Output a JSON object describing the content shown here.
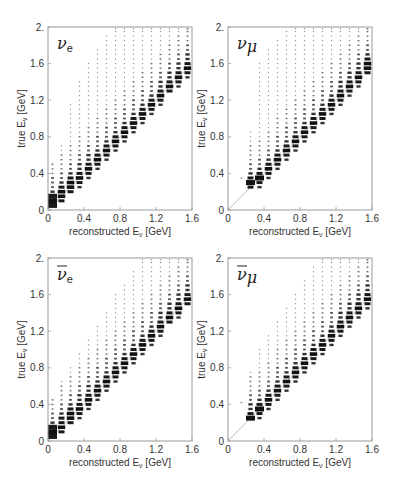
{
  "figure": {
    "panels": [
      {
        "id": "nu_e",
        "label_base": "ν",
        "label_sub": "e",
        "bar": false
      },
      {
        "id": "nu_mu",
        "label_base": "ν",
        "label_sub": "μ",
        "bar": false
      },
      {
        "id": "nubar_e",
        "label_base": "ν",
        "label_sub": "e",
        "bar": true
      },
      {
        "id": "nubar_mu",
        "label_base": "ν",
        "label_sub": "μ",
        "bar": true
      }
    ],
    "xlabel": "reconstructed E",
    "xlabel_sub": "ν",
    "xlabel_unit": " [GeV]",
    "ylabel": "true E",
    "ylabel_sub": "ν",
    "ylabel_unit": " [GeV]",
    "xticks": [
      "0",
      "0.4",
      "0.8",
      "1.2",
      "1.6"
    ],
    "yticks": [
      "0",
      "0.4",
      "0.8",
      "1.2",
      "1.6",
      "2."
    ]
  },
  "chart_data": [
    {
      "type": "heatmap",
      "title": "ν_e",
      "xlabel": "reconstructed E_ν [GeV]",
      "ylabel": "true E_ν [GeV]",
      "xlim": [
        0,
        1.6
      ],
      "ylim": [
        0,
        2.0
      ],
      "xticks": [
        0,
        0.4,
        0.8,
        1.2,
        1.6
      ],
      "yticks": [
        0,
        0.4,
        0.8,
        1.2,
        1.6,
        2.0
      ],
      "diagonal_reference": true,
      "x_bin_centers": [
        0.05,
        0.15,
        0.25,
        0.35,
        0.45,
        0.55,
        0.65,
        0.75,
        0.85,
        0.95,
        1.05,
        1.15,
        1.25,
        1.35,
        1.45,
        1.55
      ],
      "true_min": [
        0.05,
        0.1,
        0.2,
        0.25,
        0.35,
        0.45,
        0.55,
        0.6,
        0.7,
        0.75,
        0.85,
        0.95,
        1.05,
        1.15,
        1.25,
        1.35
      ],
      "true_max": [
        0.5,
        0.7,
        1.15,
        1.4,
        1.6,
        1.75,
        1.9,
        2.0,
        2.0,
        2.0,
        2.0,
        2.0,
        2.0,
        2.0,
        2.0,
        2.0
      ],
      "peak": [
        0.1,
        0.18,
        0.27,
        0.36,
        0.46,
        0.56,
        0.66,
        0.76,
        0.86,
        0.96,
        1.06,
        1.16,
        1.27,
        1.37,
        1.47,
        1.57
      ]
    },
    {
      "type": "heatmap",
      "title": "ν_μ",
      "xlabel": "reconstructed E_ν [GeV]",
      "ylabel": "true E_ν [GeV]",
      "xlim": [
        0,
        1.6
      ],
      "ylim": [
        0,
        2.0
      ],
      "xticks": [
        0,
        0.4,
        0.8,
        1.2,
        1.6
      ],
      "yticks": [
        0,
        0.4,
        0.8,
        1.2,
        1.6,
        2.0
      ],
      "diagonal_reference": true,
      "stray_points": [
        [
          0.15,
          0.35
        ]
      ],
      "x_bin_centers": [
        0.25,
        0.35,
        0.45,
        0.55,
        0.65,
        0.75,
        0.85,
        0.95,
        1.05,
        1.15,
        1.25,
        1.35,
        1.45,
        1.55
      ],
      "true_min": [
        0.25,
        0.25,
        0.25,
        0.35,
        0.4,
        0.45,
        0.5,
        0.6,
        0.65,
        0.75,
        0.85,
        0.95,
        1.05,
        1.15
      ],
      "true_max": [
        0.85,
        1.6,
        1.75,
        1.85,
        1.95,
        2.0,
        2.0,
        2.0,
        2.0,
        2.0,
        2.0,
        2.0,
        2.0,
        2.0
      ],
      "peak": [
        0.29,
        0.34,
        0.44,
        0.56,
        0.66,
        0.76,
        0.86,
        0.96,
        1.06,
        1.16,
        1.27,
        1.37,
        1.47,
        1.58
      ]
    },
    {
      "type": "heatmap",
      "title": "ν̄_e",
      "xlabel": "reconstructed E_ν [GeV]",
      "ylabel": "true E_ν [GeV]",
      "xlim": [
        0,
        1.6
      ],
      "ylim": [
        0,
        2.0
      ],
      "xticks": [
        0,
        0.4,
        0.8,
        1.2,
        1.6
      ],
      "yticks": [
        0,
        0.4,
        0.8,
        1.2,
        1.6,
        2.0
      ],
      "diagonal_reference": true,
      "x_bin_centers": [
        0.05,
        0.15,
        0.25,
        0.35,
        0.45,
        0.55,
        0.65,
        0.75,
        0.85,
        0.95,
        1.05,
        1.15,
        1.25,
        1.35,
        1.45,
        1.55
      ],
      "true_min": [
        0.05,
        0.1,
        0.15,
        0.25,
        0.35,
        0.45,
        0.55,
        0.65,
        0.75,
        0.8,
        0.9,
        1.0,
        1.1,
        1.2,
        1.3,
        1.4
      ],
      "true_max": [
        0.45,
        0.65,
        0.8,
        0.95,
        1.1,
        1.25,
        1.4,
        1.6,
        1.7,
        1.85,
        2.0,
        2.0,
        2.0,
        2.0,
        2.0,
        2.0
      ],
      "peak": [
        0.08,
        0.17,
        0.27,
        0.36,
        0.46,
        0.56,
        0.66,
        0.76,
        0.86,
        0.96,
        1.06,
        1.16,
        1.27,
        1.37,
        1.47,
        1.57
      ]
    },
    {
      "type": "heatmap",
      "title": "ν̄_μ",
      "xlabel": "reconstructed E_ν [GeV]",
      "ylabel": "true E_ν [GeV]",
      "xlim": [
        0,
        1.6
      ],
      "ylim": [
        0,
        2.0
      ],
      "xticks": [
        0,
        0.4,
        0.8,
        1.2,
        1.6
      ],
      "yticks": [
        0,
        0.4,
        0.8,
        1.2,
        1.6,
        2.0
      ],
      "diagonal_reference": true,
      "stray_points": [
        [
          0.15,
          0.42
        ]
      ],
      "x_bin_centers": [
        0.25,
        0.35,
        0.45,
        0.55,
        0.65,
        0.75,
        0.85,
        0.95,
        1.05,
        1.15,
        1.25,
        1.35,
        1.45,
        1.55
      ],
      "true_min": [
        0.25,
        0.25,
        0.3,
        0.4,
        0.45,
        0.55,
        0.65,
        0.7,
        0.8,
        0.9,
        1.0,
        1.1,
        1.2,
        1.3
      ],
      "true_max": [
        0.75,
        1.0,
        1.15,
        1.3,
        1.45,
        1.6,
        1.75,
        1.9,
        2.0,
        2.0,
        2.0,
        2.0,
        2.0,
        2.0
      ],
      "peak": [
        0.26,
        0.35,
        0.45,
        0.56,
        0.66,
        0.76,
        0.86,
        0.96,
        1.06,
        1.16,
        1.27,
        1.37,
        1.47,
        1.57
      ]
    }
  ]
}
